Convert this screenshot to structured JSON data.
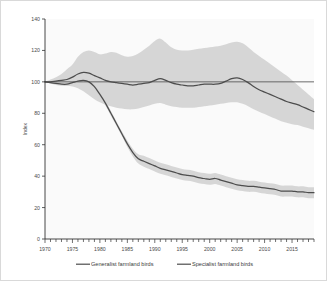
{
  "chart_data": {
    "type": "line",
    "title": "",
    "subtitle": "",
    "xlabel": "",
    "ylabel": "Index",
    "xlim": [
      1970,
      2019
    ],
    "ylim": [
      0,
      140
    ],
    "grid": false,
    "legend_position": "bottom",
    "y_ticks": [
      0,
      20,
      40,
      60,
      80,
      100,
      120,
      140
    ],
    "y_tick_labels": [
      "0",
      "20",
      "40",
      "60",
      "80",
      "100",
      "120",
      "140"
    ],
    "x_ticks": [
      1970,
      1975,
      1980,
      1985,
      1990,
      1995,
      2000,
      2005,
      2010,
      2015
    ],
    "x_tick_labels": [
      "1970",
      "1975",
      "1980",
      "1985",
      "1990",
      "1995",
      "2000",
      "2005",
      "2010",
      "2015"
    ],
    "x_minor_tick_interval": 1,
    "reference_line": 100,
    "x": [
      1970,
      1971,
      1972,
      1973,
      1974,
      1975,
      1976,
      1977,
      1978,
      1979,
      1980,
      1981,
      1982,
      1983,
      1984,
      1985,
      1986,
      1987,
      1988,
      1989,
      1990,
      1991,
      1992,
      1993,
      1994,
      1995,
      1996,
      1997,
      1998,
      1999,
      2000,
      2001,
      2002,
      2003,
      2004,
      2005,
      2006,
      2007,
      2008,
      2009,
      2010,
      2011,
      2012,
      2013,
      2014,
      2015,
      2016,
      2017,
      2018,
      2019
    ],
    "series": [
      {
        "name": "Generalist farmland birds",
        "color": "#4d4d4d",
        "values": [
          100,
          100,
          100.5,
          101,
          101.5,
          103,
          105,
          106,
          105.5,
          104,
          102.5,
          101,
          100,
          99.5,
          99,
          98.5,
          98,
          98.5,
          99,
          99.5,
          101,
          102,
          101,
          99.5,
          98.5,
          98,
          97.5,
          97.5,
          98,
          98.5,
          98.5,
          98.5,
          99,
          100.5,
          102,
          102.5,
          101.5,
          99.5,
          97,
          95,
          93.5,
          92,
          90.5,
          89,
          87.5,
          86.5,
          85.5,
          84,
          82.5,
          81
        ],
        "band_lower": [
          100,
          99,
          98.5,
          98,
          97.5,
          97,
          96,
          94,
          91.5,
          89,
          87,
          85.5,
          84.5,
          83.5,
          83,
          82.5,
          82.5,
          83,
          84,
          85,
          86,
          86.5,
          85.5,
          84.5,
          84,
          83.5,
          83.5,
          83.5,
          84,
          84.5,
          85,
          85.5,
          86,
          86.5,
          87,
          87,
          86,
          84.5,
          82.5,
          81,
          79.5,
          78,
          76.5,
          75,
          74,
          73,
          72.5,
          71.5,
          70.5,
          69.5
        ],
        "band_upper": [
          100,
          101.5,
          103,
          105,
          108,
          111,
          116,
          119,
          120,
          119,
          117.5,
          118,
          119,
          118.5,
          117,
          116,
          116.5,
          118,
          120.5,
          123,
          126,
          127.5,
          125,
          122,
          120.5,
          120,
          120,
          120.5,
          121,
          121.5,
          122,
          122.5,
          123,
          124,
          125,
          125.5,
          124.5,
          122,
          119,
          116.5,
          114,
          111.5,
          109,
          106.5,
          104,
          101,
          98,
          95,
          92,
          89
        ]
      },
      {
        "name": "Specialist farmland birds",
        "color": "#4d4d4d",
        "values": [
          100,
          99.5,
          99,
          98.5,
          98.5,
          99.5,
          100.5,
          101,
          100,
          97,
          92,
          86.5,
          80,
          73.5,
          67,
          60.5,
          55,
          51,
          49.5,
          48,
          46.5,
          45,
          44,
          43,
          42,
          41,
          40.5,
          40,
          39,
          38.5,
          38,
          38.5,
          37.5,
          36.5,
          35.5,
          34.5,
          34,
          33.5,
          33.5,
          33,
          32.5,
          32,
          31.5,
          30.5,
          30.5,
          30.5,
          30,
          30,
          29.5,
          29.5
        ],
        "band_lower": [
          100,
          99,
          98,
          97.5,
          97.5,
          98.5,
          99.5,
          100,
          98.5,
          95.5,
          90.5,
          85,
          78.5,
          72,
          65.5,
          58.5,
          52.5,
          48,
          46,
          44.5,
          43,
          41.5,
          40.5,
          39.5,
          38.5,
          37.5,
          37,
          36.5,
          35.5,
          35,
          34.5,
          35,
          34,
          33,
          32,
          31,
          30.5,
          30,
          30,
          29.5,
          29,
          28.5,
          28,
          27,
          27,
          27,
          26.5,
          26.5,
          26,
          26
        ],
        "band_upper": [
          100,
          100.5,
          100,
          99.5,
          99.5,
          100.5,
          101.5,
          102,
          101.5,
          98.5,
          93.5,
          88,
          81.5,
          75,
          68.5,
          62.5,
          57.5,
          54,
          53,
          51.5,
          50,
          48.5,
          47.5,
          46.5,
          45.5,
          44.5,
          44,
          43.5,
          42.5,
          42,
          41.5,
          42,
          41,
          40,
          39,
          38,
          37.5,
          37,
          37,
          36.5,
          36,
          35.5,
          35,
          34,
          34,
          34,
          33.5,
          33.5,
          33,
          33
        ]
      }
    ],
    "band_color": "#d4d4d4",
    "background_color": "#fafafa",
    "axis_color": "#333333"
  },
  "legend": {
    "items": [
      {
        "label": "Generalist farmland birds"
      },
      {
        "label": "Specialist farmland birds"
      }
    ]
  },
  "axes": {
    "y_title": "Index"
  }
}
